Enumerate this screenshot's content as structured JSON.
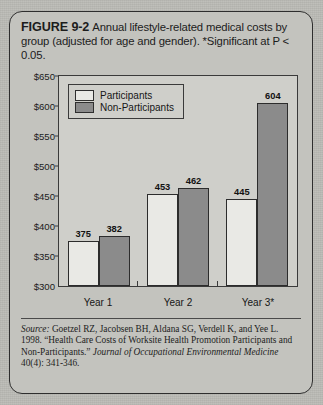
{
  "figure": {
    "number_label": "FIGURE 9-2",
    "caption_text": "Annual lifestyle-related medical costs by group (adjusted for age and gender). *Significant at P < 0.05."
  },
  "legend": {
    "items": [
      {
        "label": "Participants",
        "color": "#e9e9e5"
      },
      {
        "label": "Non-Participants",
        "color": "#8b8b8b"
      }
    ]
  },
  "source": {
    "label": "Source:",
    "citation": " Goetzel RZ, Jacobsen BH, Aldana SG, Verdell K, and Yee L. 1998. “Health Care Costs of Worksite Health Promotion Participants and Non-Participants.” ",
    "journal": "Journal of Occupational Environmental Medicine",
    "citation_tail": " 40(4): 341-346."
  },
  "chart_data": {
    "type": "bar",
    "title": "Annual lifestyle-related medical costs by group (adjusted for age and gender)",
    "xlabel": "",
    "ylabel": "",
    "categories": [
      "Year 1",
      "Year 2",
      "Year 3*"
    ],
    "series": [
      {
        "name": "Participants",
        "values": [
          375,
          453,
          445
        ],
        "color": "#e9e9e5"
      },
      {
        "name": "Non-Participants",
        "values": [
          382,
          462,
          604
        ],
        "color": "#8b8b8b"
      }
    ],
    "ylim": [
      300,
      650
    ],
    "ytick_step": 50,
    "ytick_labels": [
      "$650",
      "$600",
      "$550",
      "$500",
      "$450",
      "$400",
      "$350",
      "$300"
    ],
    "ytick_values": [
      650,
      600,
      550,
      500,
      450,
      400,
      350,
      300
    ],
    "grid": false,
    "legend_position": "top-left",
    "data_labels": true,
    "annotations": [
      "*Significant at P < 0.05."
    ]
  }
}
